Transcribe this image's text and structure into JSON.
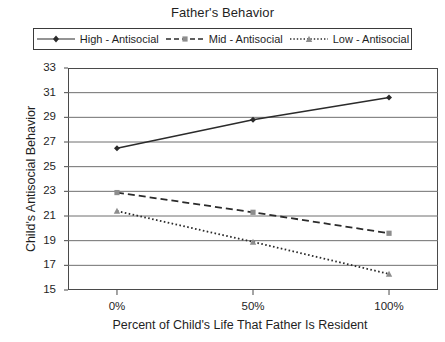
{
  "chart_data": {
    "type": "line",
    "title": "Father's Behavior",
    "xlabel": "Percent of Child's Life That Father Is Resident",
    "ylabel": "Child's Antisocial Behavior",
    "categories": [
      "0%",
      "50%",
      "100%"
    ],
    "x": [
      0,
      50,
      100
    ],
    "xlim": [
      -18,
      118
    ],
    "ylim": [
      15,
      33
    ],
    "yticks": [
      15,
      17,
      19,
      21,
      23,
      25,
      27,
      29,
      31,
      33
    ],
    "grid": "horizontal",
    "legend_position": "top",
    "series": [
      {
        "name": "High - Antisocial",
        "values": [
          26.5,
          28.8,
          30.6
        ],
        "line_style": "solid",
        "marker": "diamond",
        "color": "#2b2b2b"
      },
      {
        "name": "Mid - Antisocial",
        "values": [
          22.9,
          21.3,
          19.6
        ],
        "line_style": "dashed",
        "marker": "square",
        "color": "#2b2b2b"
      },
      {
        "name": "Low - Antisocial",
        "values": [
          21.4,
          18.9,
          16.3
        ],
        "line_style": "dotted",
        "marker": "triangle",
        "color": "#2b2b2b"
      }
    ]
  },
  "axis": {
    "ytick_labels": [
      "33",
      "31",
      "29",
      "27",
      "25",
      "23",
      "21",
      "19",
      "17",
      "15"
    ],
    "xtick_labels": [
      "0%",
      "50%",
      "100%"
    ]
  },
  "colors": {
    "frame": "#4a4a4a",
    "gridline": "#6f6f6f",
    "series": "#2b2b2b",
    "text": "#1f1f1f"
  }
}
